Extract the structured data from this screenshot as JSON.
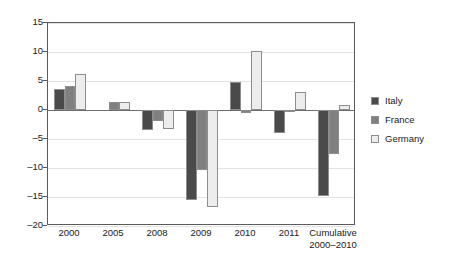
{
  "chart_data": {
    "type": "bar",
    "title": "",
    "subtitle": "",
    "xlabel": "",
    "ylabel": "",
    "categories": [
      "2000",
      "2005",
      "2008",
      "2009",
      "2010",
      "2011",
      "Cumulative 2000–2010"
    ],
    "category_lines": [
      [
        "2000"
      ],
      [
        "2005"
      ],
      [
        "2008"
      ],
      [
        "2009"
      ],
      [
        "2010"
      ],
      [
        "2011"
      ],
      [
        "Cumulative",
        "2000–2010"
      ]
    ],
    "series": [
      {
        "name": "Italy",
        "color": "#4a4a4a",
        "values": [
          3.6,
          0,
          -3.4,
          -15.6,
          4.8,
          -4.0,
          -14.9
        ]
      },
      {
        "name": "France",
        "color": "#808080",
        "values": [
          4.2,
          1.4,
          -1.9,
          -10.3,
          -0.5,
          -0.3,
          -7.5
        ]
      },
      {
        "name": "Germany",
        "color": "#ededed",
        "values": [
          6.2,
          1.3,
          -3.3,
          -16.8,
          10.2,
          3.1,
          0.9
        ]
      }
    ],
    "ylim": [
      -20,
      15
    ],
    "yticks": [
      15,
      10,
      5,
      0,
      -5,
      -10,
      -15,
      -20
    ],
    "ytick_labels": [
      "15",
      "10",
      "5",
      "0",
      "–5",
      "–10",
      "–15",
      "–20"
    ],
    "grid": true,
    "grid_axis": "y",
    "legend": {
      "position": "right",
      "entries": [
        {
          "label": "Italy",
          "color": "#4a4a4a"
        },
        {
          "label": "France",
          "color": "#808080"
        },
        {
          "label": "Germany",
          "color": "#ededed"
        }
      ]
    },
    "zero_line": 0,
    "bar_border_color": "#8d8d8d",
    "axis_color": "#5a5a5a",
    "gridline_color": "#e2e2e2",
    "background": "#ffffff"
  }
}
